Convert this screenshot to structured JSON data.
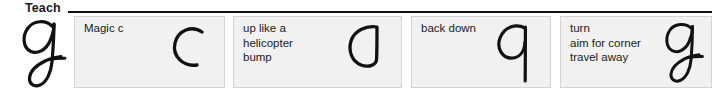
{
  "header": {
    "label": "Teach",
    "rule_color": "#111111"
  },
  "exemplar": {
    "letter": "g",
    "icon": "cursive-g-glyph",
    "color": "#111111"
  },
  "panels": [
    {
      "id": "panel-magic-c",
      "text": "Magic c",
      "glyph": "open-c-stroke",
      "glyph_letter": "c"
    },
    {
      "id": "panel-up-like-a-helicopter-bump",
      "text": "up like a\nhelicopter\nbump",
      "glyph": "helicopter-bump-stroke",
      "glyph_letter": "d"
    },
    {
      "id": "panel-back-down",
      "text": "back down",
      "glyph": "q-stroke",
      "glyph_letter": "q"
    },
    {
      "id": "panel-turn-aim-travel",
      "text": "turn\naim for corner\ntravel away",
      "glyph": "cursive-g-glyph",
      "glyph_letter": "g"
    }
  ],
  "colors": {
    "panel_background": "#f1f1f1",
    "panel_border": "#d4d4d4",
    "ink": "#111111",
    "text": "#1a1a1a",
    "page_background": "#ffffff"
  }
}
